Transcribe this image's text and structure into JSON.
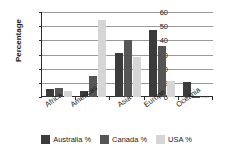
{
  "chart_data": {
    "type": "bar",
    "title": "",
    "xlabel": "",
    "ylabel": "Percentage",
    "ylim": [
      0,
      60
    ],
    "yticks": [
      0,
      10,
      20,
      30,
      40,
      50,
      60
    ],
    "grid": true,
    "legend_position": "bottom",
    "categories": [
      "Africa",
      "Americas",
      "Asia",
      "Europe",
      "Oceania"
    ],
    "series": [
      {
        "name": "Australia %",
        "color": "#3b3b3b",
        "values": [
          5.5,
          4,
          31,
          47,
          10.5
        ]
      },
      {
        "name": "Canada %",
        "color": "#555555",
        "values": [
          6.5,
          15,
          40,
          36,
          0.3
        ]
      },
      {
        "name": "USA %",
        "color": "#d6d6d6",
        "values": [
          4,
          54.5,
          28,
          11.5,
          0.3
        ]
      }
    ]
  },
  "axis": {
    "tick_0": "0",
    "tick_10": "10",
    "tick_20": "20",
    "tick_30": "30",
    "tick_40": "40",
    "tick_50": "50",
    "tick_60": "60"
  },
  "colors": {
    "australia": "#3b3b3b",
    "canada": "#555555",
    "usa": "#d6d6d6",
    "gridline": "#9a9a9a",
    "axis": "#2b2b2b",
    "background": "#ffffff"
  }
}
